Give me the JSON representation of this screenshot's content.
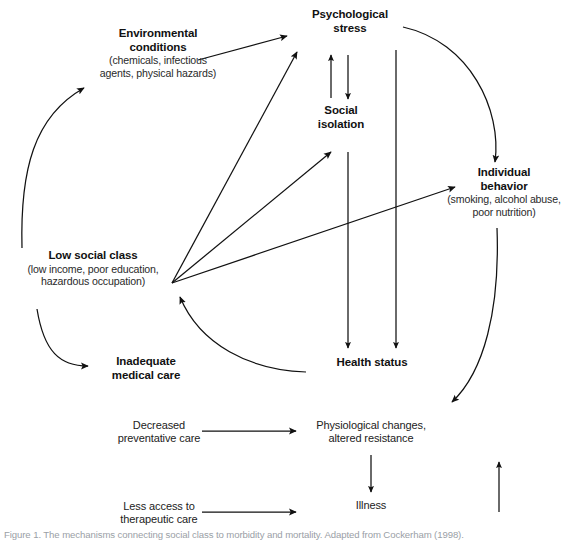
{
  "figure": {
    "caption": "Figure 1. The mechanisms connecting social class to morbidity and mortality. Adapted from Cockerham (1998).",
    "ink_color": "#111111",
    "background": "#ffffff"
  },
  "nodes": {
    "psychological_stress": {
      "heading": "Psychological\nstress",
      "line1": "Psychological",
      "line2": "stress",
      "sub": ""
    },
    "environmental_conditions": {
      "line1": "Environmental",
      "line2": "conditions",
      "sub1": "(chemicals, infectious",
      "sub2": "agents, physical hazards)"
    },
    "social_isolation": {
      "line1": "Social",
      "line2": "isolation",
      "sub": ""
    },
    "individual_behavior": {
      "line1": "Individual",
      "line2": "behavior",
      "sub1": "(smoking, alcohol abuse,",
      "sub2": "poor nutrition)"
    },
    "low_social_class": {
      "line1": "Low social class",
      "sub1": "(low income, poor education,",
      "sub2": "hazardous occupation)"
    },
    "inadequate_medical_care": {
      "line1": "Inadequate",
      "line2": "medical care"
    },
    "health_status": {
      "line1": "Health status"
    },
    "decreased_preventative_care": {
      "line1": "Decreased",
      "line2": "preventative care"
    },
    "less_access_therapeutic_care": {
      "line1": "Less access to",
      "line2": "therapeutic care"
    },
    "physiological_changes": {
      "line1": "Physiological changes,",
      "line2": "altered resistance"
    },
    "illness": {
      "line1": "Illness"
    }
  },
  "edges": [
    {
      "name": "low-social-class-to-environmental-conditions",
      "from": "low_social_class",
      "to": "environmental_conditions",
      "style": "curved"
    },
    {
      "name": "environmental-conditions-to-psychological-stress",
      "from": "environmental_conditions",
      "to": "psychological_stress",
      "style": "straight"
    },
    {
      "name": "low-social-class-to-psychological-stress",
      "from": "low_social_class",
      "to": "psychological_stress",
      "style": "straight"
    },
    {
      "name": "low-social-class-to-social-isolation",
      "from": "low_social_class",
      "to": "social_isolation",
      "style": "straight"
    },
    {
      "name": "low-social-class-to-individual-behavior",
      "from": "low_social_class",
      "to": "individual_behavior",
      "style": "straight"
    },
    {
      "name": "social-isolation-to-psychological-stress",
      "from": "social_isolation",
      "to": "psychological_stress",
      "style": "straight"
    },
    {
      "name": "psychological-stress-to-social-isolation",
      "from": "psychological_stress",
      "to": "social_isolation",
      "style": "straight"
    },
    {
      "name": "social-isolation-to-health-status",
      "from": "social_isolation",
      "to": "health_status",
      "style": "straight"
    },
    {
      "name": "psychological-stress-to-health-status",
      "from": "psychological_stress",
      "to": "health_status",
      "style": "straight"
    },
    {
      "name": "psychological-stress-to-individual-behavior",
      "from": "psychological_stress",
      "to": "individual_behavior",
      "style": "curved"
    },
    {
      "name": "low-social-class-to-inadequate-medical-care",
      "from": "low_social_class",
      "to": "inadequate_medical_care",
      "style": "curved"
    },
    {
      "name": "health-status-to-low-social-class",
      "from": "health_status",
      "to": "low_social_class",
      "style": "curved"
    },
    {
      "name": "decreased-preventative-care-to-physiological-changes",
      "from": "decreased_preventative_care",
      "to": "physiological_changes",
      "style": "straight"
    },
    {
      "name": "less-access-therapeutic-care-to-physiological-changes",
      "from": "less_access_therapeutic_care",
      "to": "physiological_changes",
      "style": "straight"
    },
    {
      "name": "individual-behavior-to-physiological-changes",
      "from": "individual_behavior",
      "to": "physiological_changes",
      "style": "curved"
    },
    {
      "name": "physiological-changes-to-illness",
      "from": "physiological_changes",
      "to": "illness",
      "style": "straight"
    },
    {
      "name": "illness-feedback-upward",
      "from": "illness",
      "to": "individual_behavior",
      "style": "straight"
    }
  ]
}
